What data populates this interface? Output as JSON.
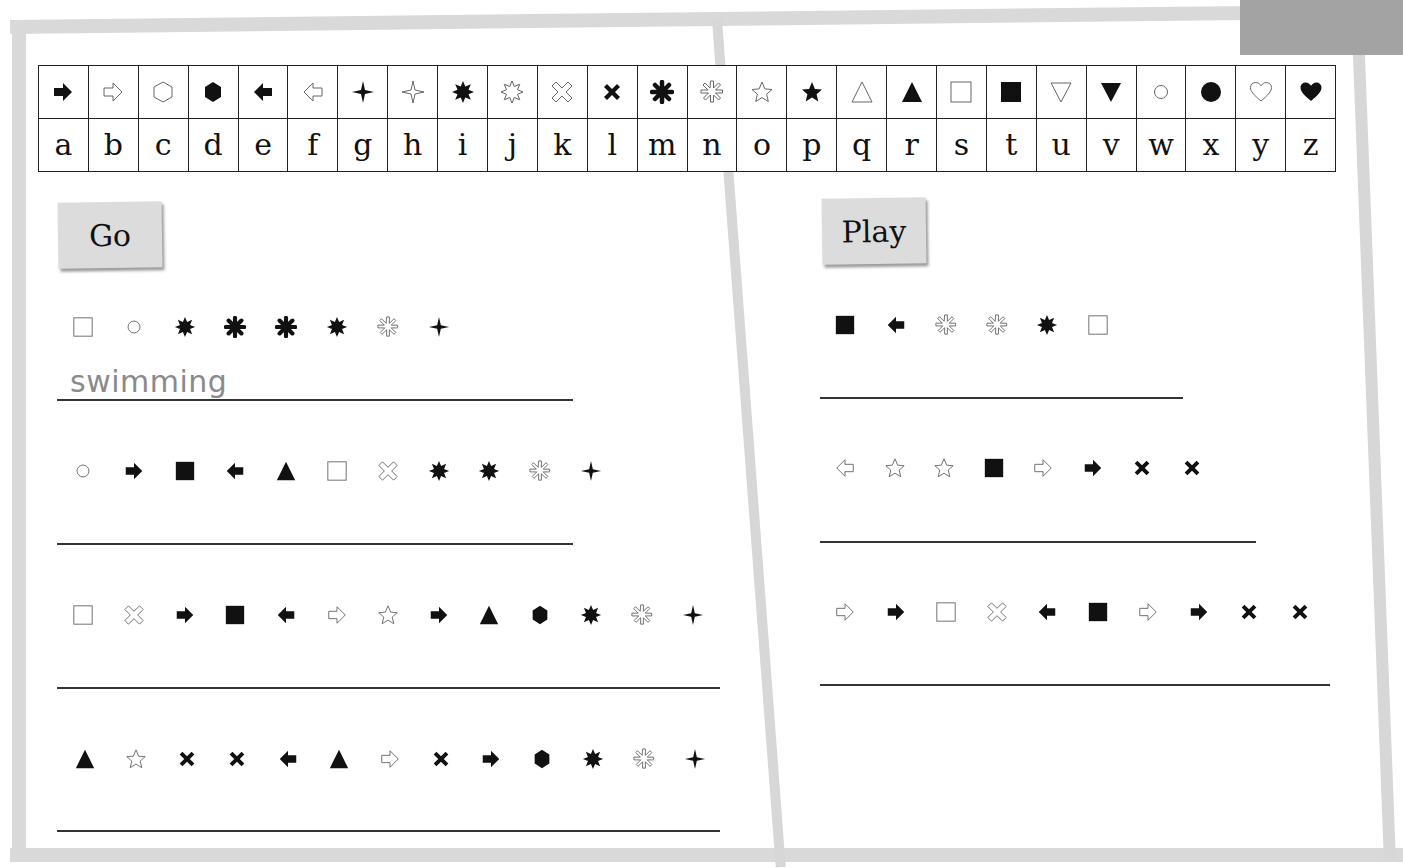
{
  "cipher_key": {
    "symbols": [
      "arrow-right-filled",
      "arrow-right-outline",
      "hexagon-outline",
      "hexagon-filled",
      "arrow-left-filled",
      "arrow-left-outline",
      "sparkle-filled",
      "sparkle-outline",
      "burst-filled",
      "burst-outline",
      "cross-outline",
      "cross-filled",
      "asterisk-filled",
      "asterisk-outline",
      "star-outline",
      "star-filled",
      "triangle-outline",
      "triangle-filled",
      "square-outline",
      "square-filled",
      "triangle-down-outline",
      "triangle-down-filled",
      "circle-outline",
      "circle-filled",
      "heart-outline",
      "heart-filled"
    ],
    "letters": [
      "a",
      "b",
      "c",
      "d",
      "e",
      "f",
      "g",
      "h",
      "i",
      "j",
      "k",
      "l",
      "m",
      "n",
      "o",
      "p",
      "q",
      "r",
      "s",
      "t",
      "u",
      "v",
      "w",
      "x",
      "y",
      "z"
    ]
  },
  "left_page": {
    "label": "Go",
    "puzzles": [
      {
        "symbols": [
          "square-outline",
          "circle-outline",
          "burst-filled",
          "asterisk-filled",
          "asterisk-filled",
          "burst-filled",
          "asterisk-outline",
          "sparkle-filled"
        ],
        "answer": "swimming"
      },
      {
        "symbols": [
          "circle-outline",
          "arrow-right-filled",
          "square-filled",
          "arrow-left-filled",
          "triangle-filled",
          "square-outline",
          "cross-outline",
          "burst-filled",
          "burst-filled",
          "asterisk-outline",
          "sparkle-filled"
        ],
        "answer": ""
      },
      {
        "symbols": [
          "square-outline",
          "cross-outline",
          "arrow-right-filled",
          "square-filled",
          "arrow-left-filled",
          "arrow-right-outline",
          "star-outline",
          "arrow-right-filled",
          "triangle-filled",
          "hexagon-filled",
          "burst-filled",
          "asterisk-outline",
          "sparkle-filled"
        ],
        "answer": ""
      },
      {
        "symbols": [
          "triangle-filled",
          "star-outline",
          "cross-filled",
          "cross-filled",
          "arrow-left-filled",
          "triangle-filled",
          "arrow-right-outline",
          "cross-filled",
          "arrow-right-filled",
          "hexagon-filled",
          "burst-filled",
          "asterisk-outline",
          "sparkle-filled"
        ],
        "answer": ""
      }
    ]
  },
  "right_page": {
    "label": "Play",
    "puzzles": [
      {
        "symbols": [
          "square-filled",
          "arrow-left-filled",
          "asterisk-outline",
          "asterisk-outline",
          "burst-filled",
          "square-outline"
        ],
        "answer": ""
      },
      {
        "symbols": [
          "arrow-left-outline",
          "star-outline",
          "star-outline",
          "square-filled",
          "arrow-right-outline",
          "arrow-right-filled",
          "cross-filled",
          "cross-filled"
        ],
        "answer": ""
      },
      {
        "symbols": [
          "arrow-right-outline",
          "arrow-right-filled",
          "square-outline",
          "cross-outline",
          "arrow-left-filled",
          "square-filled",
          "arrow-right-outline",
          "arrow-right-filled",
          "cross-filled",
          "cross-filled"
        ],
        "answer": ""
      }
    ]
  },
  "colors": {
    "frame": "#d9d9d9",
    "corner_tab": "#a3a3a3",
    "label_bg": "#dcdcdc",
    "answer_text": "#8a8a8a",
    "ink": "#111111"
  }
}
